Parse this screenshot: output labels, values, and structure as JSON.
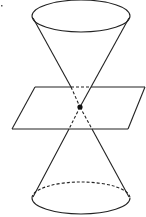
{
  "diagram": {
    "components": [
      "upper-nappe",
      "lower-nappe",
      "plane",
      "vertex-point"
    ],
    "colors": {
      "stroke": "#222222",
      "background": "#ffffff"
    }
  }
}
